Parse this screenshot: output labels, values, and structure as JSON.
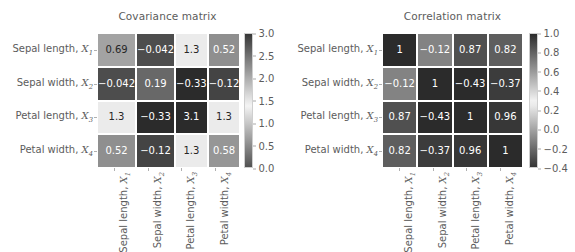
{
  "chart_data": [
    {
      "type": "heatmap",
      "title": "Covariance matrix",
      "xlabel": "",
      "ylabel": "",
      "categories": [
        "Sepal length, X1",
        "Sepal width, X2",
        "Petal length, X3",
        "Petal width, X4"
      ],
      "row_labels": [
        "Sepal length, ",
        "Sepal width, ",
        "Petal length, ",
        "Petal width, "
      ],
      "row_symbols": [
        "X",
        "X",
        "X",
        "X"
      ],
      "row_subscripts": [
        "1",
        "2",
        "3",
        "4"
      ],
      "col_labels": [
        "Sepal length, ",
        "Sepal width, ",
        "Petal length, ",
        "Petal width, "
      ],
      "col_symbols": [
        "X",
        "X",
        "X",
        "X"
      ],
      "col_subscripts": [
        "1",
        "2",
        "3",
        "4"
      ],
      "values": [
        [
          0.69,
          -0.042,
          1.3,
          0.52
        ],
        [
          -0.042,
          0.19,
          -0.33,
          -0.12
        ],
        [
          1.3,
          -0.33,
          3.1,
          1.3
        ],
        [
          0.52,
          -0.12,
          1.3,
          0.58
        ]
      ],
      "cell_text": [
        [
          "0.69",
          "−0.042",
          "1.3",
          "0.52"
        ],
        [
          "−0.042",
          "0.19",
          "−0.33",
          "−0.12"
        ],
        [
          "1.3",
          "−0.33",
          "3.1",
          "1.3"
        ],
        [
          "0.52",
          "−0.12",
          "1.3",
          "0.58"
        ]
      ],
      "colorbar": {
        "ticks": [
          "3.0",
          "2.5",
          "2.0",
          "1.5",
          "1.0",
          "0.5",
          "0.0"
        ],
        "tick_values": [
          3.0,
          2.5,
          2.0,
          1.5,
          1.0,
          0.5,
          0.0
        ],
        "vmin": -0.33,
        "vmax": 3.1,
        "orientation": "vertical",
        "position": "right"
      },
      "grid": false,
      "legend": "none"
    },
    {
      "type": "heatmap",
      "title": "Correlation matrix",
      "xlabel": "",
      "ylabel": "",
      "categories": [
        "Sepal length, X1",
        "Sepal width, X2",
        "Petal length, X3",
        "Petal width, X4"
      ],
      "row_labels": [
        "Sepal length, ",
        "Sepal width, ",
        "Petal length, ",
        "Petal width, "
      ],
      "row_symbols": [
        "X",
        "X",
        "X",
        "X"
      ],
      "row_subscripts": [
        "1",
        "2",
        "3",
        "4"
      ],
      "col_labels": [
        "Sepal length, ",
        "Sepal width, ",
        "Petal length, ",
        "Petal width, "
      ],
      "col_symbols": [
        "X",
        "X",
        "X",
        "X"
      ],
      "col_subscripts": [
        "1",
        "2",
        "3",
        "4"
      ],
      "values": [
        [
          1,
          -0.12,
          0.87,
          0.82
        ],
        [
          -0.12,
          1,
          -0.43,
          -0.37
        ],
        [
          0.87,
          -0.43,
          1,
          0.96
        ],
        [
          0.82,
          -0.37,
          0.96,
          1
        ]
      ],
      "cell_text": [
        [
          "1",
          "−0.12",
          "0.87",
          "0.82"
        ],
        [
          "−0.12",
          "1",
          "−0.43",
          "−0.37"
        ],
        [
          "0.87",
          "−0.43",
          "1",
          "0.96"
        ],
        [
          "0.82",
          "−0.37",
          "0.96",
          "1"
        ]
      ],
      "colorbar": {
        "ticks": [
          "1.0",
          "0.8",
          "0.6",
          "0.4",
          "0.2",
          "0.0",
          "−0.2",
          "−0.4"
        ],
        "tick_values": [
          1.0,
          0.8,
          0.6,
          0.4,
          0.2,
          0.0,
          -0.2,
          -0.4
        ],
        "vmin": -0.43,
        "vmax": 1.0,
        "orientation": "vertical",
        "position": "right"
      },
      "grid": false,
      "legend": "none"
    }
  ],
  "figure": {
    "background": "#ffffff",
    "text_color": "#5c5c5c",
    "cell_label_light": "#ffffff",
    "cell_label_dark": "#262626",
    "colormap": "binary_r"
  }
}
